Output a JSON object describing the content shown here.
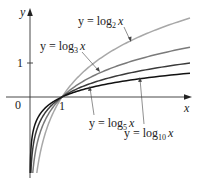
{
  "chart_data": {
    "type": "line",
    "title": "",
    "xlabel": "x",
    "ylabel": "y",
    "xlim": [
      -0.7,
      5.0
    ],
    "ylim": [
      -2.3,
      2.6
    ],
    "grid": false,
    "legend": "inline labels with leader lines",
    "origin_label": "0",
    "x_ticks": [
      {
        "value": 1,
        "label": "1"
      }
    ],
    "y_ticks": [
      {
        "value": 1,
        "label": "1"
      }
    ],
    "series": [
      {
        "name": "y = log₂ x",
        "base": 2,
        "color": "#a8a8a8",
        "x": [
          0.06,
          0.25,
          0.5,
          1,
          2,
          3,
          4,
          5
        ],
        "values": [
          -4.06,
          -2.0,
          -1.0,
          0,
          1.0,
          1.58,
          2.0,
          2.32
        ]
      },
      {
        "name": "y = log₃ x",
        "base": 3,
        "color": "#7a7a7a",
        "x": [
          0.06,
          0.25,
          0.5,
          1,
          2,
          3,
          4,
          5
        ],
        "values": [
          -2.56,
          -1.26,
          -0.63,
          0,
          0.63,
          1.0,
          1.26,
          1.46
        ]
      },
      {
        "name": "y = log₅ x",
        "base": 5,
        "color": "#3a3a3a",
        "x": [
          0.06,
          0.25,
          0.5,
          1,
          2,
          3,
          4,
          5
        ],
        "values": [
          -1.75,
          -0.86,
          -0.43,
          0,
          0.43,
          0.68,
          0.86,
          1.0
        ]
      },
      {
        "name": "y = log₁₀ x",
        "base": 10,
        "color": "#111111",
        "x": [
          0.06,
          0.25,
          0.5,
          1,
          2,
          3,
          4,
          5
        ],
        "values": [
          -1.22,
          -0.6,
          -0.3,
          0,
          0.3,
          0.48,
          0.6,
          0.7
        ]
      }
    ],
    "annotations": [
      {
        "text": "y = log₂ x",
        "points_to": "log2 curve"
      },
      {
        "text": "y = log₃ x",
        "points_to": "log3 curve"
      },
      {
        "text": "y = log₅ x",
        "points_to": "log5 curve"
      },
      {
        "text": "y = log₁₀ x",
        "points_to": "log10 curve"
      }
    ]
  },
  "labels": {
    "x_axis": "x",
    "y_axis": "y",
    "origin": "0",
    "x_tick_1": "1",
    "y_tick_1": "1",
    "log2": {
      "prefix": "y = log",
      "base": "2",
      "var": "x"
    },
    "log3": {
      "prefix": "y = log",
      "base": "3",
      "var": "x"
    },
    "log5": {
      "prefix": "y = log",
      "base": "5",
      "var": "x"
    },
    "log10": {
      "prefix": "y = log",
      "base": "10",
      "var": "x"
    }
  }
}
